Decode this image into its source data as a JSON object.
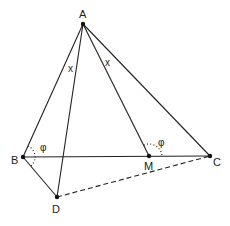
{
  "diagram": {
    "title": "",
    "points": {
      "A": {
        "label": "A",
        "x": 83,
        "y": 24
      },
      "B": {
        "label": "B",
        "x": 23,
        "y": 157
      },
      "C": {
        "label": "C",
        "x": 210,
        "y": 156
      },
      "M": {
        "label": "M",
        "x": 149,
        "y": 156
      },
      "D": {
        "label": "D",
        "x": 57,
        "y": 197
      }
    },
    "segments": [
      {
        "from": "A",
        "to": "B",
        "style": "solid"
      },
      {
        "from": "A",
        "to": "C",
        "style": "solid"
      },
      {
        "from": "A",
        "to": "M",
        "style": "solid"
      },
      {
        "from": "A",
        "to": "D",
        "style": "solid"
      },
      {
        "from": "B",
        "to": "C",
        "style": "solid"
      },
      {
        "from": "B",
        "to": "D",
        "style": "solid"
      },
      {
        "from": "D",
        "to": "C",
        "style": "dashed"
      }
    ],
    "angle_labels": [
      {
        "text": "x",
        "at": "angle BAD"
      },
      {
        "text": "x",
        "at": "angle MAC"
      },
      {
        "text": "φ",
        "at": "angle at B"
      },
      {
        "text": "φ",
        "at": "angle AMC"
      }
    ],
    "labels": {
      "A": "A",
      "B": "B",
      "C": "C",
      "M": "M",
      "D": "D",
      "x1": "x",
      "x2": "x",
      "phi1": "φ",
      "phi2": "φ"
    }
  }
}
